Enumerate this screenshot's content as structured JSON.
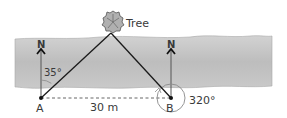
{
  "diagram": {
    "tree_label": "Tree",
    "point_a": "A",
    "point_b": "B",
    "north_label_a": "N",
    "north_label_b": "N",
    "angle_a": "35°",
    "angle_b": "320°",
    "distance": "30 m"
  },
  "colors": {
    "river_top": "#c8c8c8",
    "river_mid": "#b4b4b4",
    "lines": "#1a1a1a",
    "north_arrow": "#555555"
  }
}
